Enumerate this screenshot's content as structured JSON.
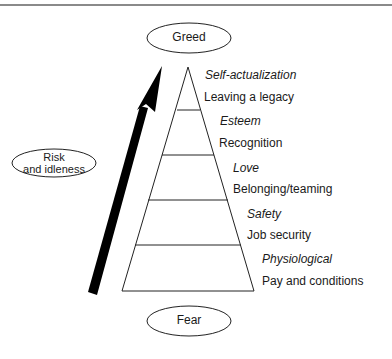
{
  "top_oval": {
    "label": "Greed"
  },
  "bottom_oval": {
    "label": "Fear"
  },
  "side_oval": {
    "line1": "Risk",
    "line2": "and idleness"
  },
  "arrow": {
    "direction": "up",
    "color": "#000000"
  },
  "pyramid": {
    "levels": [
      {
        "category": "Self-actualization",
        "description": "Leaving a legacy"
      },
      {
        "category": "Esteem",
        "description": "Recognition"
      },
      {
        "category": "Love",
        "description": "Belonging/teaming"
      },
      {
        "category": "Safety",
        "description": "Job security"
      },
      {
        "category": "Physiological",
        "description": "Pay and conditions"
      }
    ]
  },
  "colors": {
    "line": "#222222",
    "rule": "#8a8a8a",
    "background": "#ffffff"
  }
}
